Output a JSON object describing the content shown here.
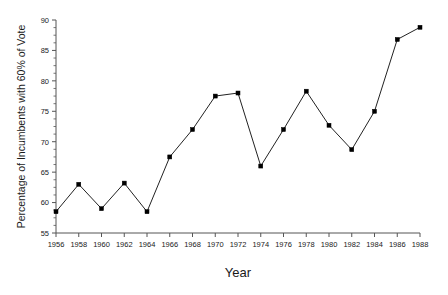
{
  "chart_data": {
    "type": "line",
    "title": "",
    "xlabel": "Year",
    "ylabel": "Percentage of Incumbents with 60% of Vote",
    "x": [
      1956,
      1958,
      1960,
      1962,
      1964,
      1966,
      1968,
      1970,
      1972,
      1974,
      1976,
      1978,
      1980,
      1982,
      1984,
      1986,
      1988
    ],
    "values": [
      58.5,
      63.0,
      59.0,
      63.2,
      58.5,
      67.5,
      72.0,
      77.5,
      78.0,
      66.0,
      72.0,
      78.3,
      72.7,
      68.7,
      75.0,
      86.8,
      88.8
    ],
    "xlim": [
      1956,
      1988
    ],
    "ylim": [
      55,
      90
    ],
    "xticks": [
      1956,
      1958,
      1960,
      1962,
      1964,
      1966,
      1968,
      1970,
      1972,
      1974,
      1976,
      1978,
      1980,
      1982,
      1984,
      1986,
      1988
    ],
    "xtick_labels": [
      "1956",
      "1958",
      "1960",
      "1962",
      "1964",
      "1966",
      "1968",
      "1970",
      "1972",
      "1974",
      "1976",
      "1978",
      "1980",
      "1982",
      "1984",
      "1986",
      "1988"
    ],
    "yticks": [
      55,
      60,
      65,
      70,
      75,
      80,
      85,
      90
    ],
    "ytick_labels": [
      "55",
      "60",
      "65",
      "70",
      "75",
      "80",
      "85",
      "90"
    ],
    "y_minor_step": 1.25,
    "grid": false,
    "legend": false,
    "legend_position": "none",
    "line_color": "#222222",
    "marker_color": "#000000",
    "marker": "square",
    "axis_color": "#555555"
  }
}
